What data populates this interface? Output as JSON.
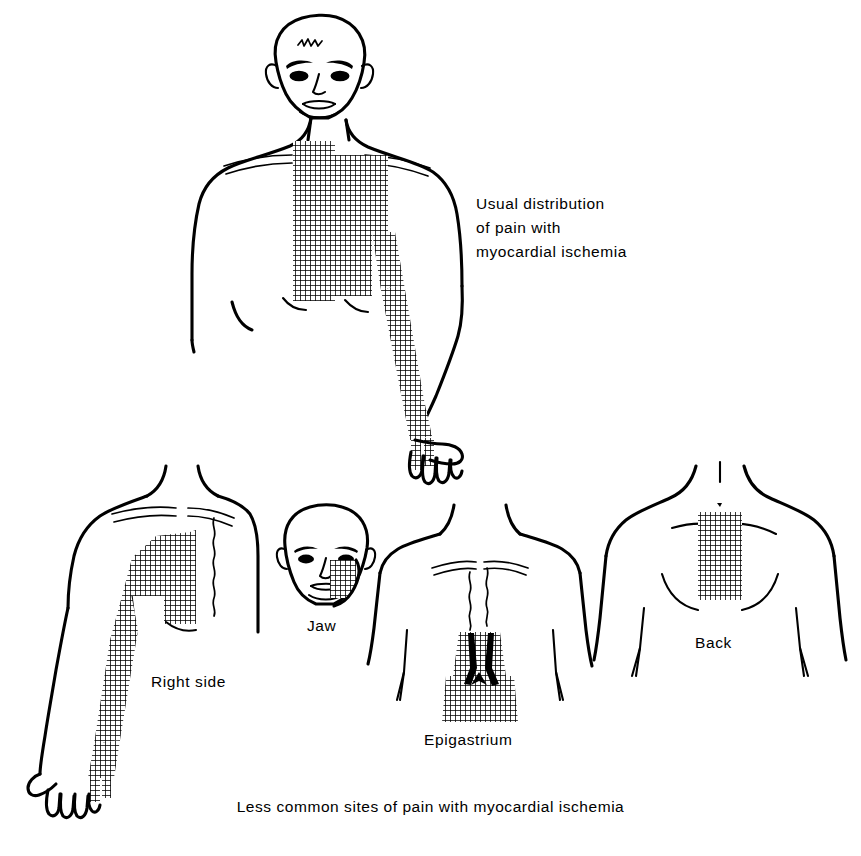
{
  "figure": {
    "title_absent": true,
    "subject": "Distribution of pain with myocardial ischemia",
    "style": "line drawing with crosshatch shading",
    "colors": {
      "ink": "#000000",
      "background": "#ffffff",
      "hatch": "#000000"
    }
  },
  "legend": {
    "line1": "Usual distribution",
    "line2": "of pain with",
    "line3": "myocardial ischemia"
  },
  "bottom_caption": {
    "text": "Less common sites of pain with myocardial ischemia"
  },
  "panels": [
    {
      "id": "usual",
      "label": "",
      "description": "Anterior full torso with head, retrosternal and left pectoral shading extending down ulnar aspect of left arm to the fourth and fifth fingers"
    },
    {
      "id": "right-side",
      "label": "Right side",
      "description": "Right chest shading extending down the ulnar aspect of the right arm"
    },
    {
      "id": "jaw",
      "label": "Jaw",
      "description": "Head with shading over the lower jaw and cheek"
    },
    {
      "id": "epigastrium",
      "label": "Epigastrium",
      "description": "Upper abdomen below the xiphoid, trapezoidal shaded patch"
    },
    {
      "id": "back",
      "label": "Back",
      "description": "Posterior thorax with rectangular interscapular shaded patch"
    }
  ],
  "hatch_pattern": {
    "cell_px": 5,
    "line_width_px": 1.5,
    "orientation": "orthogonal grid"
  }
}
